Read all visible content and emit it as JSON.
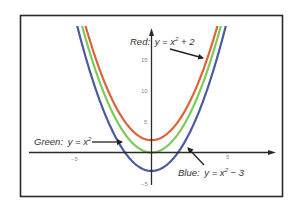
{
  "chart_data": {
    "type": "line",
    "title": "",
    "xlabel": "",
    "ylabel": "",
    "xlim": [
      -9.5,
      8.7
    ],
    "ylim": [
      -6.3,
      22.6
    ],
    "grid": false,
    "x_ticks": [
      -5,
      5
    ],
    "y_ticks": [
      -5,
      5,
      10,
      15
    ],
    "series": [
      {
        "name": "Red",
        "equation": "y = x^2 + 2",
        "color": "#e0623a",
        "shift": 2
      },
      {
        "name": "Green",
        "equation": "y = x^2",
        "color": "#7ccb5a",
        "shift": 0
      },
      {
        "name": "Blue",
        "equation": "y = x^2 - 3",
        "color": "#4c5a9e",
        "shift": -3
      }
    ],
    "annotations": [
      {
        "name": "Red",
        "text_prefix": "Red:",
        "text": "y = x",
        "sup": "2",
        "text_suffix": " + 2"
      },
      {
        "name": "Green",
        "text_prefix": "Green:",
        "text": "y = x",
        "sup": "2",
        "text_suffix": ""
      },
      {
        "name": "Blue",
        "text_prefix": "Blue:",
        "text": "y = x",
        "sup": "2",
        "text_suffix": " − 3"
      }
    ]
  },
  "ticks": {
    "x_neg5": "−5",
    "x_5": "5",
    "y_neg5": "−5",
    "y_5": "5",
    "y_10": "10",
    "y_15": "15"
  },
  "labels": {
    "red_prefix": "Red:",
    "red_eq": "y = x",
    "red_sup": "2",
    "red_suffix": " + 2",
    "green_prefix": "Green:",
    "green_eq": "y = x",
    "green_sup": "2",
    "blue_prefix": "Blue:",
    "blue_eq": "y = x",
    "blue_sup": "2",
    "blue_suffix": " − 3"
  }
}
